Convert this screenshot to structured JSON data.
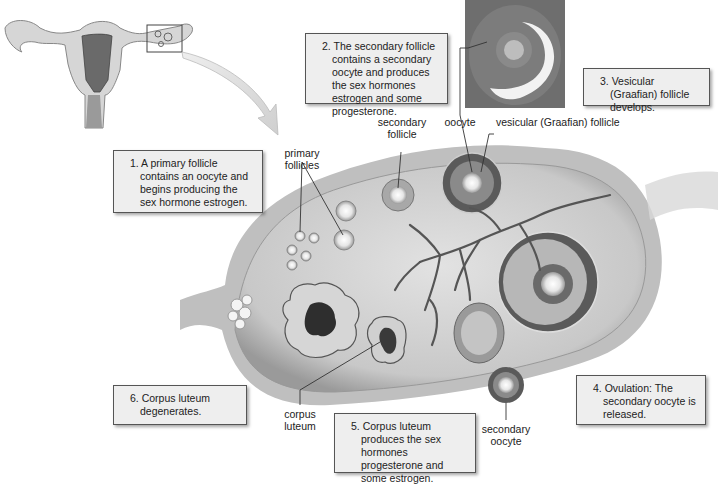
{
  "figure": {
    "callouts": [
      {
        "id": "step1",
        "number": "1.",
        "text": "A primary follicle contains an oocyte and begins producing the sex hormone estrogen."
      },
      {
        "id": "step2",
        "number": "2.",
        "text": "The secondary follicle contains a secondary oocyte and produces the sex hormones estrogen and some progesterone."
      },
      {
        "id": "step3",
        "number": "3.",
        "text": "Vesicular (Graafian) follicle develops."
      },
      {
        "id": "step4",
        "number": "4.",
        "text": "Ovulation: The secondary oocyte is released."
      },
      {
        "id": "step5",
        "number": "5.",
        "text": "Corpus luteum produces the sex hormones progesterone and some estrogen."
      },
      {
        "id": "step6",
        "number": "6.",
        "text": "Corpus luteum degenerates."
      }
    ],
    "labels": {
      "primary_follicles": "primary follicles",
      "secondary_follicle": "secondary follicle",
      "oocyte": "oocyte",
      "vesicular_follicle": "vesicular (Graafian) follicle",
      "corpus_luteum": "corpus luteum",
      "secondary_oocyte": "secondary oocyte"
    },
    "colors": {
      "callout_bg": "#eeeeee",
      "callout_border": "#555555",
      "tissue_light": "#d9d9d9",
      "tissue_mid": "#a8a8a8",
      "tissue_dark": "#4a4a4a"
    }
  }
}
